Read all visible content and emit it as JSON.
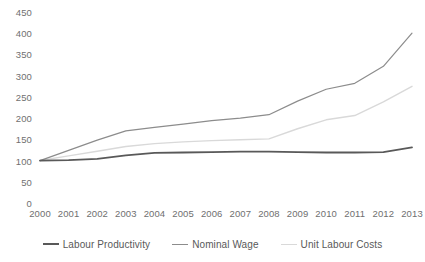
{
  "chart_data": {
    "type": "line",
    "title": "",
    "xlabel": "",
    "ylabel": "",
    "categories": [
      "2000",
      "2001",
      "2002",
      "2003",
      "2004",
      "2005",
      "2006",
      "2007",
      "2008",
      "2009",
      "2010",
      "2011",
      "2012",
      "2013"
    ],
    "ylim": [
      0,
      450
    ],
    "yticks": [
      0,
      50,
      100,
      150,
      200,
      250,
      300,
      350,
      400,
      450
    ],
    "grid": false,
    "legend_position": "bottom",
    "series": [
      {
        "name": "Labour Productivity",
        "color": "#595959",
        "width": 1.8,
        "values": [
          100,
          101,
          104,
          112,
          118,
          119,
          120,
          121,
          121,
          120,
          119,
          119,
          120,
          131
        ]
      },
      {
        "name": "Nominal Wage",
        "color": "#8c8c8c",
        "width": 1.2,
        "values": [
          100,
          124,
          148,
          170,
          178,
          186,
          194,
          200,
          208,
          240,
          268,
          282,
          322,
          400
        ]
      },
      {
        "name": "Unit Labour Costs",
        "color": "#d9d9d9",
        "width": 1.4,
        "values": [
          100,
          111,
          122,
          133,
          140,
          144,
          147,
          149,
          151,
          175,
          196,
          206,
          238,
          275
        ]
      }
    ]
  },
  "axes": {
    "y_tick_labels": [
      "450",
      "400",
      "350",
      "300",
      "250",
      "200",
      "150",
      "100",
      "50",
      "0"
    ],
    "x_tick_labels": [
      "2000",
      "2001",
      "2002",
      "2003",
      "2004",
      "2005",
      "2006",
      "2007",
      "2008",
      "2009",
      "2010",
      "2011",
      "2012",
      "2013"
    ]
  },
  "legend": {
    "items": [
      {
        "label": "Labour Productivity",
        "color": "#595959",
        "width": 2.2
      },
      {
        "label": "Nominal Wage",
        "color": "#8c8c8c",
        "width": 1.4
      },
      {
        "label": "Unit Labour Costs",
        "color": "#d9d9d9",
        "width": 1.6
      }
    ]
  }
}
